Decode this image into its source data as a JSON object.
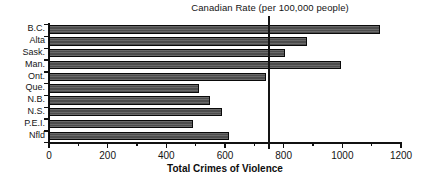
{
  "chart_data": {
    "type": "bar",
    "orientation": "horizontal",
    "title": "Canadian Rate (per 100,000 people)",
    "xlabel": "Total Crimes of Violence",
    "ylabel": "",
    "categories": [
      "B.C.",
      "Alta",
      "Sask.",
      "Man.",
      "Ont.",
      "Que.",
      "N.B.",
      "N.S.",
      "P.E.I.",
      "Nfld"
    ],
    "values": [
      1130,
      880,
      805,
      995,
      740,
      510,
      550,
      590,
      490,
      615
    ],
    "xlim": [
      0,
      1200
    ],
    "xticks": [
      0,
      200,
      400,
      600,
      800,
      1000,
      1200
    ],
    "xtick_labels": [
      "0",
      "200",
      "400",
      "600",
      "800",
      "1000",
      "1200"
    ],
    "minor_xticks": [
      100,
      300,
      500,
      700,
      900,
      1100
    ],
    "grid": false,
    "legend": false,
    "annotations": [
      {
        "name": "canadian-rate-reference-line",
        "label": "Canadian Rate (per 100,000 people)",
        "value": 750,
        "orientation": "vertical"
      }
    ],
    "bar_color": "#4d4d4d",
    "bar_border_color": "#0a0a0a",
    "axis_color": "#111111",
    "background": "#ffffff"
  }
}
